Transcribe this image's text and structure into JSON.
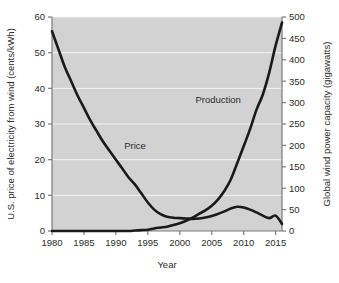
{
  "chart_data": {
    "type": "line",
    "title": "",
    "xlabel": "Year",
    "ylabel": "U.S. price of electricity from wind (cents/kWh)",
    "y2label": "Global wind power capacity (gigawatts)",
    "xlim": [
      1980,
      2016
    ],
    "ylim": [
      0,
      60
    ],
    "y2lim": [
      0,
      500
    ],
    "xticks": [
      1980,
      1985,
      1990,
      1995,
      2000,
      2005,
      2010,
      2015
    ],
    "xtick_labels": [
      "1980",
      "1985",
      "1990",
      "1995",
      "2000",
      "2005",
      "2010",
      "2015"
    ],
    "yticks": [
      0,
      10,
      20,
      30,
      40,
      50,
      60
    ],
    "ytick_labels": [
      "0",
      "10",
      "20",
      "30",
      "40",
      "50",
      "60"
    ],
    "y2ticks": [
      0,
      50,
      100,
      150,
      200,
      250,
      300,
      350,
      400,
      450,
      500
    ],
    "y2tick_labels": [
      "0",
      "50",
      "100",
      "150",
      "200",
      "250",
      "300",
      "350",
      "400",
      "450",
      "500"
    ],
    "grid": true,
    "grid_orientation": "horizontal",
    "legend": "inline-annotations",
    "plot_background": "#d2d2d2",
    "gridline_color": "#f4f4f4",
    "curve_color": "#1a1a1a",
    "annotations": [
      {
        "text": "Price",
        "x": 1993.0,
        "axis": "left",
        "value": 23.0
      },
      {
        "text": "Production",
        "x": 2006.0,
        "axis": "right",
        "value": 300.0
      }
    ],
    "series": [
      {
        "name": "Price",
        "axis": "left",
        "units": "cents/kWh",
        "x": [
          1980,
          1981,
          1982,
          1983,
          1984,
          1985,
          1986,
          1987,
          1988,
          1989,
          1990,
          1991,
          1992,
          1993,
          1994,
          1995,
          1996,
          1997,
          1998,
          1999,
          2000,
          2001,
          2002,
          2003,
          2004,
          2005,
          2006,
          2007,
          2008,
          2009,
          2010,
          2011,
          2012,
          2013,
          2014,
          2015,
          2016
        ],
        "values": [
          56.0,
          51.0,
          46.0,
          42.0,
          38.0,
          34.5,
          31.0,
          28.0,
          25.0,
          22.5,
          20.0,
          17.5,
          15.0,
          13.0,
          10.5,
          8.0,
          6.0,
          4.7,
          4.0,
          3.7,
          3.6,
          3.5,
          3.4,
          3.5,
          3.8,
          4.2,
          4.8,
          5.5,
          6.3,
          6.8,
          6.6,
          6.0,
          5.2,
          4.3,
          3.6,
          4.3,
          2.0
        ]
      },
      {
        "name": "Production",
        "axis": "right",
        "units": "gigawatts",
        "x": [
          1980,
          1981,
          1982,
          1983,
          1984,
          1985,
          1986,
          1987,
          1988,
          1989,
          1990,
          1991,
          1992,
          1993,
          1994,
          1995,
          1996,
          1997,
          1998,
          1999,
          2000,
          2001,
          2002,
          2003,
          2004,
          2005,
          2006,
          2007,
          2008,
          2009,
          2010,
          2011,
          2012,
          2013,
          2014,
          2015,
          2016
        ],
        "values": [
          0,
          0,
          0,
          0,
          0,
          0,
          0,
          0,
          0,
          0,
          0,
          0,
          0,
          1,
          2,
          3,
          6,
          8,
          10,
          14,
          18,
          24,
          31,
          40,
          48,
          59,
          74,
          94,
          121,
          159,
          198,
          238,
          283,
          319,
          370,
          433,
          487
        ]
      }
    ]
  }
}
